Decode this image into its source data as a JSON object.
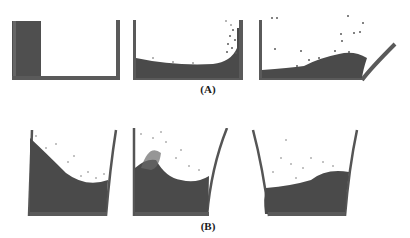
{
  "figure": {
    "row_a_label": "(A)",
    "row_b_label": "(B)",
    "colors": {
      "wall": "#555555",
      "fluid": "#4a4a4a",
      "particle": "#5a5a5a",
      "background": "#ffffff"
    },
    "row_a": [
      {
        "name": "dam-break-initial"
      },
      {
        "name": "dam-break-impact"
      },
      {
        "name": "dam-break-ramp"
      }
    ],
    "row_b": [
      {
        "name": "sloshing-tank-1"
      },
      {
        "name": "sloshing-tank-2"
      },
      {
        "name": "sloshing-tank-3"
      }
    ]
  }
}
